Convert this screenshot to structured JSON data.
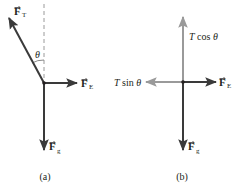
{
  "panels": {
    "a": {
      "caption": "(a)",
      "angle_label": "θ",
      "vectors": {
        "tension": {
          "symbol": "F",
          "subscript": "T",
          "color": "#3a3a3a"
        },
        "electric": {
          "symbol": "F",
          "subscript": "E",
          "color": "#3a3a3a"
        },
        "gravity": {
          "symbol": "F",
          "subscript": "g",
          "color": "#3a3a3a"
        }
      },
      "reference_line": {
        "style": "dashed",
        "color": "#9a9a9a"
      }
    },
    "b": {
      "caption": "(b)",
      "vectors": {
        "vertical_component": {
          "label": "T cos θ",
          "label_italic_part": "T",
          "label_rest": " cos ",
          "angle": "θ",
          "color": "#9a9a9a"
        },
        "horizontal_component": {
          "label": "T sin θ",
          "label_italic_part": "T",
          "label_rest": " sin ",
          "angle": "θ",
          "color": "#9a9a9a"
        },
        "electric": {
          "symbol": "F",
          "subscript": "E",
          "color": "#3a3a3a"
        },
        "gravity": {
          "symbol": "F",
          "subscript": "g",
          "color": "#3a3a3a"
        }
      }
    }
  },
  "colors": {
    "dark_vector": "#3a3a3a",
    "light_vector": "#9a9a9a",
    "text": "#231f20",
    "background": "#ffffff"
  }
}
